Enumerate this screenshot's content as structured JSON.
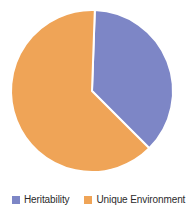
{
  "chart_data": {
    "type": "pie",
    "title": "",
    "subtitle": "",
    "xlabel": "",
    "ylabel": "",
    "grid": false,
    "legend_position": "bottom",
    "categories": [
      "Heritability",
      "Unique Environment"
    ],
    "values": [
      37,
      63
    ],
    "slices": [
      {
        "label": "Heritability",
        "value": 37,
        "color": "#7d86c6",
        "start_angle_deg": 2,
        "end_angle_deg": 135
      },
      {
        "label": "Unique Environment",
        "value": 63,
        "color": "#efa457",
        "start_angle_deg": 135,
        "end_angle_deg": 362
      }
    ]
  },
  "legend": {
    "items": [
      {
        "label": "Heritability",
        "swatch_color": "#7d86c6",
        "swatch_name": "legend-swatch-heritability"
      },
      {
        "label": "Unique Environment",
        "swatch_color": "#efa457",
        "swatch_name": "legend-swatch-unique-environment"
      }
    ]
  },
  "colors": {
    "heritability": "#7d86c6",
    "unique_environment": "#efa457",
    "slice_border": "#ffffff",
    "background": "#ffffff",
    "legend_text": "#2b2b2b"
  },
  "geometry": {
    "center_x": 92,
    "center_y": 91,
    "radius": 81
  }
}
